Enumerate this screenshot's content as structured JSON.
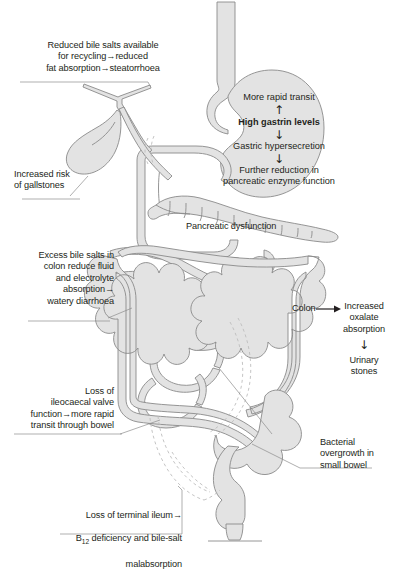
{
  "diagram": {
    "colors": {
      "background": "#ffffff",
      "organ_fill": "#e3e3e3",
      "organ_stroke": "#8a8a8a",
      "leader_line": "#8d8d8d",
      "dashed_resection": "#b9b9b9",
      "text": "#231f20"
    }
  },
  "labels": {
    "bile_salts_recycling": "Reduced bile salts available\nfor recycling→reduced\nfat absorption→steatorrhoea",
    "gallstones": "Increased risk\nof gallstones",
    "excess_bile_salts_colon": "Excess bile salts in\ncolon reduce fluid\nand electrolyte\nabsorption→\nwatery diarrhoea",
    "pancreatic_dysfunction": "Pancreatic dysfunction",
    "ileocaecal_valve": "Loss of\nileocaecal valve\nfunction→more rapid\ntransit through bowel",
    "bacterial_overgrowth": "Bacterial\novergrowth in\nsmall bowel",
    "terminal_ileum_line1": "Loss of  terminal ileum→",
    "terminal_ileum_b12_prefix": "B",
    "terminal_ileum_b12_sub": "12",
    "terminal_ileum_line2_rest": " deficiency and bile-salt",
    "terminal_ileum_line3": "malabsorption"
  },
  "stomach_flow": {
    "step1": "More rapid transit",
    "arrow1": "↑",
    "step2": "High gastrin levels",
    "arrow2": "↓",
    "step3": "Gastric hypersecretion",
    "arrow3": "↓",
    "step4": "Further reduction in\npancreatic enzyme\nfunction"
  },
  "colon_flow": {
    "source": "Colon",
    "arrow_right": "→",
    "step1": "Increased\noxalate\nabsorption",
    "arrow_down": "↓",
    "step2": "Urinary\nstones"
  }
}
